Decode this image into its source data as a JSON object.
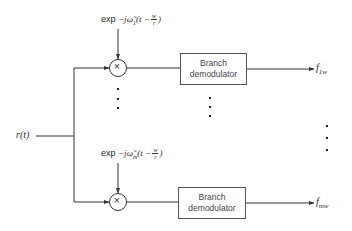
{
  "input": {
    "label": "r(t)"
  },
  "branches": [
    {
      "oscillator": {
        "prefix": "exp",
        "sign": "−",
        "j": "j",
        "omega": "ω̃",
        "sub": "1",
        "t": "t",
        "minus": "−",
        "frac_num": "w",
        "frac_den": "r"
      },
      "mixer_symbol": "×",
      "block_label_line1": "Branch",
      "block_label_line2": "demodulator",
      "output": {
        "base": "f",
        "sub": "1w"
      }
    },
    {
      "oscillator": {
        "prefix": "exp",
        "sign": "−",
        "j": "j",
        "omega": "ω̃",
        "sub": "m",
        "t": "t",
        "minus": "−",
        "frac_num": "w",
        "frac_den": "r"
      },
      "mixer_symbol": "×",
      "block_label_line1": "Branch",
      "block_label_line2": "demodulator",
      "output": {
        "base": "f",
        "sub": "mw"
      }
    }
  ],
  "ellipsis": "⋮",
  "colors": {
    "line": "#333333",
    "box_border": "#555555",
    "text": "#2a2a2a"
  }
}
